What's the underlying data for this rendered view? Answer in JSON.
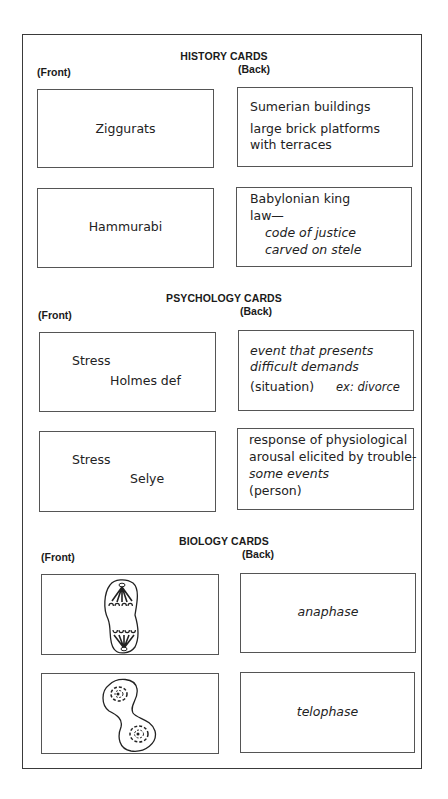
{
  "sections": [
    {
      "title": "HISTORY CARDS",
      "front_label": "(Front)",
      "back_label": "(Back)",
      "cards": [
        {
          "front": "Ziggurats",
          "back": [
            "Sumerian buildings",
            "large brick platforms",
            "with terraces"
          ]
        },
        {
          "front": "Hammurabi",
          "back": [
            "Babylonian king",
            "law—",
            "code of justice",
            "carved on stele"
          ]
        }
      ]
    },
    {
      "title": "PSYCHOLOGY CARDS",
      "front_label": "(Front)",
      "back_label": "(Back)",
      "cards": [
        {
          "front": [
            "Stress",
            "Holmes def"
          ],
          "back": [
            "event that presents",
            "difficult demands",
            "(situation)",
            "ex: divorce"
          ]
        },
        {
          "front": [
            "Stress",
            "Selye"
          ],
          "back": [
            "response of physiological",
            "arousal elicited by trouble-",
            "some events",
            "(person)"
          ]
        }
      ]
    },
    {
      "title": "BIOLOGY CARDS",
      "front_label": "(Front)",
      "back_label": "(Back)",
      "cards": [
        {
          "front_image": "anaphase-cell-drawing",
          "back": "anaphase"
        },
        {
          "front_image": "telophase-cell-drawing",
          "back": "telophase"
        }
      ]
    }
  ]
}
